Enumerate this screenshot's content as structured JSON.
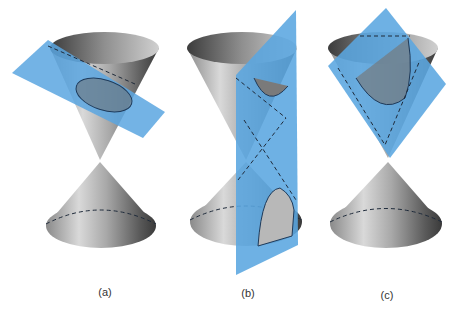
{
  "figure": {
    "colors": {
      "background": "#ffffff",
      "plane": "#5aa6e0",
      "cone_light": "#e6e6e6",
      "cone_dark": "#4a4a4a",
      "dash": "#1e2a3a"
    },
    "panels": [
      {
        "id": "a",
        "label": "(a)",
        "section": "ellipse"
      },
      {
        "id": "b",
        "label": "(b)",
        "section": "hyperbola"
      },
      {
        "id": "c",
        "label": "(c)",
        "section": "parabola"
      }
    ]
  }
}
